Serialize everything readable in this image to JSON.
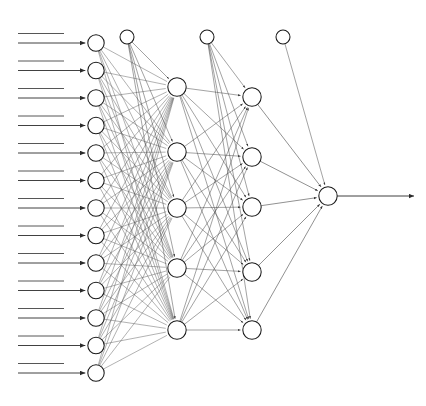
{
  "figure": {
    "kind": "neural-network-diagram",
    "software_style": "R neuralnet plot",
    "background_color": "#ffffff",
    "node_stroke_color": "#1a1a1a",
    "edge_color": "#3a3a3a",
    "text_color": "#2b2b2b"
  },
  "layers": {
    "input": {
      "name": "input-layer",
      "count": 13,
      "labels": [
        "crim",
        "zn",
        "indus",
        "chas",
        "nox",
        "rm",
        "age",
        "dis",
        "rad",
        "tax",
        "ptratio",
        "black",
        "lstat"
      ]
    },
    "hidden1": {
      "name": "hidden-layer-1",
      "count": 5
    },
    "hidden2": {
      "name": "hidden-layer-2",
      "count": 5
    },
    "output": {
      "name": "output-layer",
      "count": 1,
      "labels": [
        "medv"
      ]
    }
  },
  "bias_nodes": [
    {
      "label": "1",
      "feeds": "hidden-layer-1"
    },
    {
      "label": "1",
      "feeds": "hidden-layer-2"
    },
    {
      "label": "1",
      "feeds": "output-layer"
    }
  ],
  "visible_weight_labels": {
    "bias1_to_hidden1": [
      "1.24",
      "0.62993"
    ],
    "hidden1_to_hidden2": [
      "0.81186",
      "0.76771",
      "-1.7124",
      "0.68838",
      "-2.74461",
      "0.40087",
      "-0.5367"
    ],
    "bias2_to_hidden2": [
      "-1.9894"
    ],
    "hidden2_to_output": [
      "1.68752",
      "2.58258",
      "0.40469",
      "-0.57661",
      "-1.10205"
    ],
    "bias3_to_output": [
      "-1.70211"
    ],
    "input_to_hidden1": [
      "-0.2168",
      "0.3683",
      "0.39555",
      "0.60919",
      "0.84434"
    ]
  },
  "annotations": {
    "output_arrow": "response output arrow",
    "input_arrows": "13 incoming arrows, one per predictor"
  }
}
